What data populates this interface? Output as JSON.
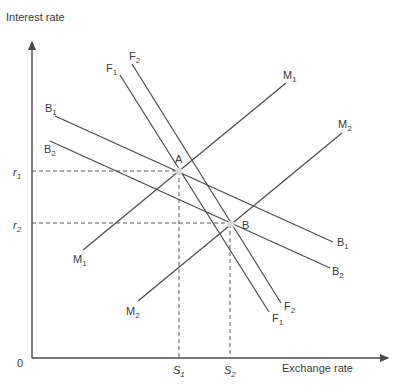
{
  "axes": {
    "y_label": "Interest rate",
    "x_label": "Exchange rate",
    "origin": "0"
  },
  "ticks": {
    "y": [
      {
        "base": "r",
        "sub": "1",
        "y": 171
      },
      {
        "base": "r",
        "sub": "2",
        "y": 223
      }
    ],
    "x": [
      {
        "base": "S",
        "sub": "1",
        "x": 179
      },
      {
        "base": "S",
        "sub": "2",
        "x": 230
      }
    ]
  },
  "points": [
    {
      "label": "A",
      "x": 179,
      "y": 171
    },
    {
      "label": "B",
      "x": 231,
      "y": 224
    }
  ],
  "curves": [
    {
      "name": "B1",
      "base": "B",
      "sub": "1",
      "from": [
        55,
        116
      ],
      "to": [
        333,
        242
      ]
    },
    {
      "name": "B2",
      "base": "B",
      "sub": "2",
      "from": [
        50,
        141
      ],
      "to": [
        330,
        268
      ]
    },
    {
      "name": "F1",
      "base": "F",
      "sub": "1",
      "from": [
        120,
        75
      ],
      "to": [
        269,
        312
      ]
    },
    {
      "name": "F2",
      "base": "F",
      "sub": "2",
      "from": [
        132,
        64
      ],
      "to": [
        281,
        303
      ]
    },
    {
      "name": "M1",
      "base": "M",
      "sub": "1",
      "from": [
        83,
        250
      ],
      "to": [
        286,
        83
      ]
    },
    {
      "name": "M2",
      "base": "M",
      "sub": "2",
      "from": [
        138,
        301
      ],
      "to": [
        342,
        133
      ]
    }
  ],
  "labels": {
    "B1_start": {
      "base": "B",
      "sub": "1"
    },
    "B1_end": {
      "base": "B",
      "sub": "1"
    },
    "B2_start": {
      "base": "B",
      "sub": "2"
    },
    "B2_end": {
      "base": "B",
      "sub": "2"
    },
    "F1_start": {
      "base": "F",
      "sub": "1"
    },
    "F1_end": {
      "base": "F",
      "sub": "1"
    },
    "F2_start": {
      "base": "F",
      "sub": "2"
    },
    "F2_end": {
      "base": "F",
      "sub": "2"
    },
    "M1_start": {
      "base": "M",
      "sub": "1"
    },
    "M1_end": {
      "base": "M",
      "sub": "1"
    },
    "M2_start": {
      "base": "M",
      "sub": "2"
    },
    "M2_end": {
      "base": "M",
      "sub": "2"
    },
    "r1": {
      "base": "r",
      "sub": "1"
    },
    "r2": {
      "base": "r",
      "sub": "2"
    },
    "S1": {
      "base": "S",
      "sub": "1"
    },
    "S2": {
      "base": "S",
      "sub": "2"
    },
    "A": "A",
    "B": "B"
  },
  "colors": {
    "line": "#4a4a4a",
    "point": "#d8d8d8",
    "text": "#3a3a3a"
  }
}
